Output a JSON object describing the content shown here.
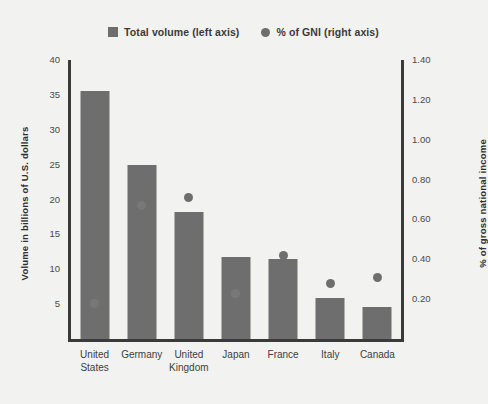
{
  "chart_data": {
    "type": "bar",
    "title": "",
    "categories": [
      "United States",
      "Germany",
      "United Kingdom",
      "Japan",
      "France",
      "Italy",
      "Canada"
    ],
    "category_lines": [
      [
        "United",
        "States"
      ],
      [
        "Germany"
      ],
      [
        "United",
        "Kingdom"
      ],
      [
        "Japan"
      ],
      [
        "France"
      ],
      [
        "Italy"
      ],
      [
        "Canada"
      ]
    ],
    "series": [
      {
        "name": "Total volume (left axis)",
        "type": "bar",
        "axis": "left",
        "values": [
          35.5,
          24.9,
          18.2,
          11.7,
          11.5,
          5.9,
          4.6
        ]
      },
      {
        "name": "% of GNI (right axis)",
        "type": "scatter",
        "axis": "right",
        "values": [
          0.18,
          0.67,
          0.71,
          0.23,
          0.42,
          0.28,
          0.31
        ]
      }
    ],
    "xlabel": "",
    "ylabel": "Volume in billions of U.S. dollars",
    "y2label": "% of gross national income",
    "ylim": [
      0,
      40
    ],
    "y2lim": [
      0,
      1.4
    ],
    "yticks": [
      "40",
      "35",
      "30",
      "25",
      "20",
      "15",
      "10",
      "5"
    ],
    "ytick_values": [
      40,
      35,
      30,
      25,
      20,
      15,
      10,
      5
    ],
    "y2ticks": [
      "1.40",
      "1.20",
      "1.00",
      "0.80",
      "0.60",
      "0.40",
      "0.20"
    ],
    "y2tick_values": [
      1.4,
      1.2,
      1.0,
      0.8,
      0.6,
      0.4,
      0.2
    ],
    "grid": false,
    "legend_position": "top-center",
    "colors": {
      "bar": "#6e6e6e",
      "dot": "#6e6e6e",
      "axis": "#3a3a3a",
      "background": "#f2f2f0",
      "text": "#3b3b3b"
    }
  },
  "legend": {
    "items": [
      {
        "label": "Total volume (left axis)",
        "marker": "square-swatch-icon"
      },
      {
        "label": "% of GNI (right axis)",
        "marker": "circle-swatch-icon"
      }
    ]
  }
}
